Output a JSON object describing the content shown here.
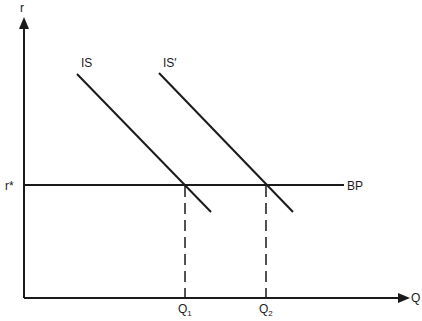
{
  "diagram": {
    "y_axis_label": "r",
    "x_axis_label": "Q",
    "r_star_label": "r*",
    "bp_label": "BP",
    "is_label": "IS",
    "is_prime_label": "IS′",
    "q1": {
      "base": "Q",
      "sub": "1"
    },
    "q2": {
      "base": "Q",
      "sub": "2"
    },
    "line_color": "#1a1a1a"
  }
}
